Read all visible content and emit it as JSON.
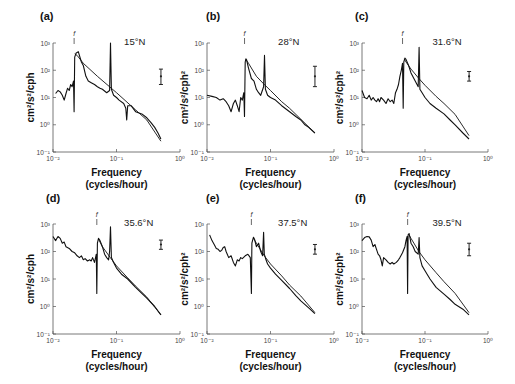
{
  "chart_data": [
    {
      "type": "line",
      "panel": "(a)",
      "annotation": "15°N",
      "f_marker": "f",
      "ylabel": "cm²/s²/cph",
      "xlabel": "Frequency",
      "xlabel2": "(cycles/hour)",
      "xscale": "log",
      "yscale": "log",
      "xlim": [
        0.01,
        1
      ],
      "ylim": [
        0.1,
        1000
      ],
      "xticks": [
        "10⁻²",
        "10⁻¹",
        "10⁰"
      ],
      "yticks": [
        "10⁻¹",
        "10⁰",
        "10¹",
        "10²",
        "10³"
      ],
      "f_freq": 0.0215,
      "peaks": {
        "inertial_freq": 0.024,
        "inertial_value": 450,
        "m2_freq": 0.0805,
        "m2_value": 1000
      },
      "series": [
        {
          "name": "observed spectrum",
          "x": [
            0.011,
            0.012,
            0.013,
            0.014,
            0.015,
            0.016,
            0.017,
            0.018,
            0.019,
            0.02,
            0.021,
            0.0215,
            0.022,
            0.023,
            0.024,
            0.025,
            0.026,
            0.028,
            0.03,
            0.033,
            0.036,
            0.04,
            0.045,
            0.05,
            0.055,
            0.06,
            0.07,
            0.078,
            0.0805,
            0.083,
            0.09,
            0.1,
            0.11,
            0.13,
            0.14,
            0.145,
            0.15,
            0.17,
            0.2,
            0.25,
            0.3,
            0.35,
            0.4,
            0.45,
            0.5
          ],
          "y": [
            14,
            18,
            16,
            12,
            8,
            14,
            22,
            18,
            30,
            25,
            40,
            3,
            300,
            420,
            450,
            480,
            350,
            200,
            150,
            60,
            40,
            35,
            30,
            25,
            22,
            20,
            15,
            18,
            1000,
            20,
            12,
            10,
            8,
            6,
            4,
            1.5,
            5,
            5,
            3,
            2.5,
            1.8,
            1.2,
            0.8,
            0.5,
            0.3
          ]
        },
        {
          "name": "model spectrum (GM)",
          "x": [
            0.022,
            0.024,
            0.03,
            0.05,
            0.1,
            0.2,
            0.3,
            0.5
          ],
          "y": [
            400,
            350,
            180,
            60,
            15,
            3.5,
            1.5,
            0.25
          ]
        }
      ],
      "error_bar": {
        "center": 60,
        "low": 30,
        "high": 110
      }
    },
    {
      "type": "line",
      "panel": "(b)",
      "annotation": "28°N",
      "f_marker": "f",
      "ylabel": "cm²/s²/cph²",
      "xlabel": "Frequency",
      "xlabel2": "(cycles/hour)",
      "xscale": "log",
      "yscale": "log",
      "xlim": [
        0.01,
        1
      ],
      "ylim": [
        0.1,
        1000
      ],
      "xticks": [
        "10⁻²",
        "10⁻¹",
        "10⁰"
      ],
      "yticks": [
        "10⁻¹",
        "10⁰",
        "10¹",
        "10²",
        "10³"
      ],
      "f_freq": 0.039,
      "peaks": {
        "inertial_freq": 0.041,
        "inertial_value": 260,
        "m2_freq": 0.0805,
        "m2_value": 350
      },
      "series": [
        {
          "name": "observed spectrum",
          "x": [
            0.01,
            0.012,
            0.014,
            0.016,
            0.018,
            0.02,
            0.022,
            0.024,
            0.026,
            0.028,
            0.03,
            0.032,
            0.034,
            0.036,
            0.038,
            0.039,
            0.04,
            0.041,
            0.042,
            0.045,
            0.05,
            0.055,
            0.06,
            0.065,
            0.07,
            0.078,
            0.0805,
            0.083,
            0.09,
            0.1,
            0.12,
            0.15,
            0.2,
            0.25,
            0.3,
            0.35,
            0.4,
            0.5
          ],
          "y": [
            12,
            11,
            10,
            8,
            9,
            7,
            5,
            3,
            6,
            8,
            5,
            3,
            10,
            8,
            15,
            2,
            200,
            260,
            240,
            120,
            50,
            40,
            20,
            15,
            12,
            25,
            350,
            20,
            12,
            10,
            8,
            5,
            3,
            2,
            1.5,
            1,
            0.8,
            0.5
          ]
        },
        {
          "name": "model spectrum (GM)",
          "x": [
            0.041,
            0.045,
            0.06,
            0.08,
            0.1,
            0.15,
            0.2,
            0.3,
            0.5
          ],
          "y": [
            250,
            180,
            60,
            30,
            18,
            7,
            4,
            1.6,
            0.5
          ]
        }
      ],
      "error_bar": {
        "center": 60,
        "low": 25,
        "high": 140
      }
    },
    {
      "type": "line",
      "panel": "(c)",
      "annotation": "31.6°N",
      "f_marker": "f",
      "ylabel": "cm²/s²/cph²",
      "xlabel": "Frequency",
      "xlabel2": "(cycles/hour)",
      "xscale": "log",
      "yscale": "log",
      "xlim": [
        0.01,
        1
      ],
      "ylim": [
        0.1,
        1000
      ],
      "xticks": [
        "10⁻²",
        "10⁻¹",
        "10⁰"
      ],
      "yticks": [
        "10⁻¹",
        "10⁰",
        "10¹",
        "10²",
        "10³"
      ],
      "f_freq": 0.044,
      "peaks": {
        "inertial_freq": 0.047,
        "inertial_value": 280,
        "m2_freq": 0.0805,
        "m2_value": 700
      },
      "series": [
        {
          "name": "observed spectrum",
          "x": [
            0.01,
            0.011,
            0.012,
            0.013,
            0.014,
            0.015,
            0.016,
            0.017,
            0.018,
            0.019,
            0.02,
            0.022,
            0.024,
            0.026,
            0.028,
            0.03,
            0.032,
            0.034,
            0.036,
            0.038,
            0.04,
            0.042,
            0.044,
            0.045,
            0.046,
            0.048,
            0.05,
            0.055,
            0.06,
            0.07,
            0.078,
            0.0805,
            0.083,
            0.09,
            0.1,
            0.12,
            0.15,
            0.2,
            0.25,
            0.3,
            0.4,
            0.5
          ],
          "y": [
            18,
            10,
            9,
            12,
            8,
            10,
            8,
            7,
            9,
            7,
            10,
            8,
            6,
            9,
            7,
            8,
            6,
            15,
            20,
            30,
            60,
            100,
            180,
            4,
            200,
            280,
            250,
            150,
            80,
            40,
            25,
            700,
            20,
            15,
            10,
            6,
            4,
            2.5,
            1.5,
            1,
            0.5,
            0.3
          ]
        },
        {
          "name": "model spectrum (GM)",
          "x": [
            0.047,
            0.05,
            0.06,
            0.08,
            0.1,
            0.15,
            0.2,
            0.3,
            0.5
          ],
          "y": [
            260,
            200,
            110,
            50,
            28,
            11,
            6,
            2.4,
            0.4
          ]
        }
      ],
      "error_bar": {
        "center": 60,
        "low": 40,
        "high": 90
      }
    },
    {
      "type": "line",
      "panel": "(d)",
      "annotation": "35.6°N",
      "f_marker": "f",
      "ylabel": "cm²/s²/cph",
      "xlabel": "Frequency",
      "xlabel2": "(cycles/hour)",
      "xscale": "log",
      "yscale": "log",
      "xlim": [
        0.01,
        1
      ],
      "ylim": [
        0.1,
        1000
      ],
      "xticks": [
        "10⁻²",
        "10⁻¹",
        "10⁰"
      ],
      "yticks": [
        "10⁻¹",
        "10⁰",
        "10¹",
        "10²",
        "10³"
      ],
      "f_freq": 0.049,
      "peaks": {
        "inertial_freq": 0.052,
        "inertial_value": 300,
        "m2_freq": 0.0805,
        "m2_value": 800
      },
      "series": [
        {
          "name": "observed spectrum",
          "x": [
            0.01,
            0.011,
            0.012,
            0.013,
            0.014,
            0.015,
            0.016,
            0.018,
            0.02,
            0.022,
            0.024,
            0.026,
            0.028,
            0.03,
            0.032,
            0.035,
            0.038,
            0.04,
            0.042,
            0.045,
            0.048,
            0.049,
            0.05,
            0.052,
            0.055,
            0.06,
            0.065,
            0.07,
            0.075,
            0.078,
            0.0805,
            0.083,
            0.09,
            0.1,
            0.12,
            0.15,
            0.2,
            0.25,
            0.3,
            0.4,
            0.5
          ],
          "y": [
            350,
            250,
            350,
            300,
            200,
            220,
            150,
            130,
            100,
            90,
            70,
            60,
            70,
            50,
            55,
            45,
            50,
            45,
            60,
            40,
            80,
            3,
            200,
            300,
            250,
            150,
            80,
            60,
            50,
            100,
            800,
            60,
            40,
            25,
            15,
            10,
            5,
            3,
            2,
            1,
            0.5
          ]
        },
        {
          "name": "model spectrum (GM)",
          "x": [
            0.052,
            0.06,
            0.08,
            0.1,
            0.15,
            0.2,
            0.3,
            0.5
          ],
          "y": [
            280,
            150,
            60,
            30,
            11,
            5.5,
            2.2,
            0.5
          ]
        }
      ],
      "error_bar": {
        "center": 180,
        "low": 120,
        "high": 260
      }
    },
    {
      "type": "line",
      "panel": "(e)",
      "annotation": "37.5°N",
      "f_marker": "f",
      "ylabel": "cm²/s²/cph²",
      "xlabel": "Frequency",
      "xlabel2": "(cycles/hour)",
      "xscale": "log",
      "yscale": "log",
      "xlim": [
        0.01,
        1
      ],
      "ylim": [
        0.1,
        1000
      ],
      "xticks": [
        "10⁻²",
        "10⁻¹",
        "10⁰"
      ],
      "yticks": [
        "10⁻¹",
        "10⁰",
        "10¹",
        "10²",
        "10³"
      ],
      "f_freq": 0.05,
      "peaks": {
        "inertial_freq": 0.054,
        "inertial_value": 330,
        "m2_freq": 0.078,
        "m2_value": 500
      },
      "series": [
        {
          "name": "observed spectrum",
          "x": [
            0.011,
            0.012,
            0.013,
            0.014,
            0.015,
            0.016,
            0.017,
            0.018,
            0.019,
            0.02,
            0.022,
            0.024,
            0.026,
            0.028,
            0.03,
            0.032,
            0.034,
            0.036,
            0.04,
            0.044,
            0.048,
            0.05,
            0.051,
            0.052,
            0.054,
            0.056,
            0.06,
            0.065,
            0.07,
            0.075,
            0.078,
            0.08,
            0.085,
            0.09,
            0.1,
            0.12,
            0.15,
            0.2,
            0.25,
            0.3,
            0.4,
            0.5
          ],
          "y": [
            400,
            250,
            180,
            130,
            120,
            100,
            110,
            140,
            150,
            100,
            60,
            70,
            40,
            30,
            50,
            45,
            60,
            55,
            70,
            80,
            60,
            3,
            200,
            250,
            330,
            280,
            150,
            200,
            100,
            70,
            500,
            80,
            50,
            35,
            25,
            15,
            9,
            4.5,
            2.5,
            1.6,
            0.9,
            0.55
          ]
        },
        {
          "name": "model spectrum (GM)",
          "x": [
            0.054,
            0.06,
            0.08,
            0.1,
            0.15,
            0.2,
            0.3,
            0.5
          ],
          "y": [
            300,
            200,
            70,
            35,
            13,
            6,
            2.4,
            0.6
          ]
        }
      ],
      "error_bar": {
        "center": 120,
        "low": 80,
        "high": 180
      }
    },
    {
      "type": "line",
      "panel": "(f)",
      "annotation": "39.5°N",
      "f_marker": "f",
      "ylabel": "cm²/s²/cph²",
      "xlabel": "Frequency",
      "xlabel2": "(cycles/hour)",
      "xscale": "log",
      "yscale": "log",
      "xlim": [
        0.01,
        1
      ],
      "ylim": [
        0.1,
        1000
      ],
      "xticks": [
        "10⁻²",
        "10⁻¹",
        "10⁰"
      ],
      "yticks": [
        "10⁻¹",
        "10⁰",
        "10¹",
        "10²",
        "10³"
      ],
      "f_freq": 0.053,
      "peaks": {
        "inertial_freq": 0.056,
        "inertial_value": 450,
        "m2_freq": 0.0805,
        "m2_value": 320
      },
      "series": [
        {
          "name": "observed spectrum",
          "x": [
            0.01,
            0.011,
            0.012,
            0.013,
            0.014,
            0.015,
            0.016,
            0.017,
            0.018,
            0.019,
            0.02,
            0.021,
            0.022,
            0.024,
            0.026,
            0.028,
            0.03,
            0.032,
            0.035,
            0.038,
            0.04,
            0.044,
            0.048,
            0.05,
            0.052,
            0.053,
            0.054,
            0.056,
            0.058,
            0.06,
            0.065,
            0.07,
            0.078,
            0.0805,
            0.083,
            0.09,
            0.1,
            0.12,
            0.15,
            0.2,
            0.25,
            0.3,
            0.4,
            0.5
          ],
          "y": [
            250,
            320,
            350,
            340,
            260,
            150,
            180,
            120,
            80,
            70,
            50,
            30,
            60,
            50,
            40,
            35,
            40,
            35,
            40,
            50,
            60,
            90,
            150,
            250,
            350,
            3,
            400,
            450,
            300,
            200,
            150,
            100,
            80,
            320,
            60,
            30,
            20,
            10,
            5,
            2.8,
            1.8,
            1.2,
            0.8,
            0.5
          ]
        },
        {
          "name": "model spectrum (GM)",
          "x": [
            0.056,
            0.06,
            0.08,
            0.1,
            0.15,
            0.2,
            0.3,
            0.5
          ],
          "y": [
            400,
            300,
            100,
            50,
            17,
            8,
            3,
            0.6
          ]
        }
      ],
      "error_bar": {
        "center": 120,
        "low": 70,
        "high": 200
      }
    }
  ]
}
